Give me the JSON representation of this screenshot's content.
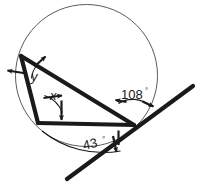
{
  "figure": {
    "type": "geometry-diagram",
    "colors": {
      "stroke_heavy": "#1a1a1a",
      "stroke_thin": "#555555",
      "background": "#ffffff",
      "text": "#1a1a1a"
    },
    "labels": {
      "angle_right_value": "108",
      "angle_right_degree": "°",
      "angle_bottom_value": "43",
      "angle_bottom_degree": "°",
      "angle_upper_left": "y",
      "angle_lower_left": "x"
    },
    "geometry": {
      "circle": {
        "cx": 86.5,
        "cy": 75.5,
        "r": 71
      },
      "triangle_vertices": {
        "top_left": {
          "x": 21,
          "y": 56
        },
        "bottom_left": {
          "x": 38,
          "y": 123
        },
        "right": {
          "x": 134,
          "y": 125
        }
      },
      "tangent_line": {
        "x1": 67,
        "y1": 179,
        "x2": 193,
        "y2": 86
      }
    }
  }
}
